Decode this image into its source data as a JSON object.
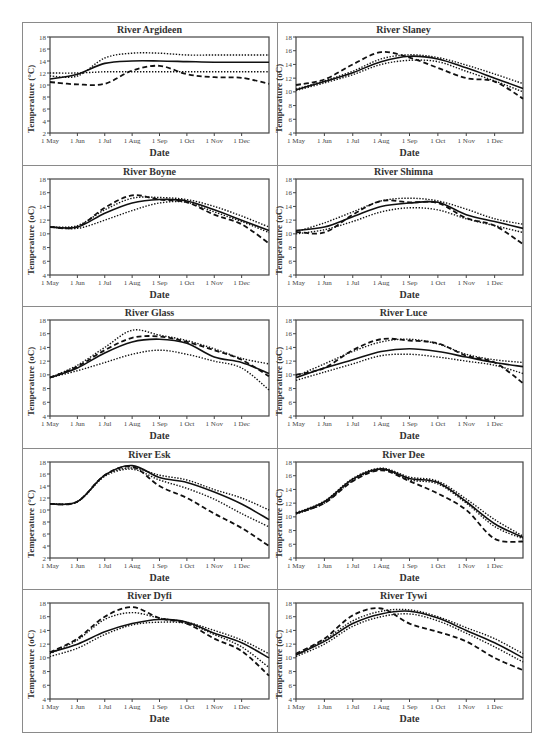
{
  "figure": {
    "x_axis_label": "Date",
    "x_ticks": [
      "1 May",
      "1 Jun",
      "1 Jul",
      "1 Aug",
      "1 Sep",
      "1 Oct",
      "1 Nov",
      "1 Dec"
    ],
    "legend_note": "Four series per panel: solid line, dashed line, upper dotted line, lower dotted line"
  },
  "chart_data": [
    {
      "type": "line",
      "title": "River Argideen",
      "xlabel": "Date",
      "ylabel": "Temperature (°C)",
      "ylim": [
        2,
        18
      ],
      "yticks": [
        2,
        4,
        6,
        8,
        10,
        12,
        14,
        16,
        18
      ],
      "categories": [
        "1 May",
        "1 Jun",
        "1 Jul",
        "1 Aug",
        "1 Sep",
        "1 Oct",
        "1 Nov",
        "1 Dec",
        "31 Dec"
      ],
      "series": [
        {
          "name": "solid",
          "style": "solid",
          "values": [
            11.0,
            11.8,
            13.6,
            14.0,
            14.0,
            13.9,
            13.8,
            13.8,
            13.8
          ]
        },
        {
          "name": "dashed",
          "style": "dashed",
          "values": [
            10.5,
            10.1,
            10.2,
            12.4,
            13.2,
            11.8,
            11.3,
            11.2,
            10.2
          ]
        },
        {
          "name": "upper-dotted",
          "style": "dotted",
          "values": [
            11.5,
            11.5,
            14.5,
            15.3,
            15.3,
            15.0,
            15.0,
            15.0,
            15.0
          ]
        },
        {
          "name": "lower-dotted",
          "style": "dotted",
          "values": [
            12.0,
            12.0,
            12.2,
            12.2,
            12.2,
            12.2,
            12.2,
            12.2,
            12.2
          ]
        }
      ]
    },
    {
      "type": "line",
      "title": "River Slaney",
      "xlabel": "Date",
      "ylabel": "Temperature (oC)",
      "ylim": [
        4,
        18
      ],
      "yticks": [
        4,
        6,
        8,
        10,
        12,
        14,
        16,
        18
      ],
      "categories": [
        "1 May",
        "1 Jun",
        "1 Jul",
        "1 Aug",
        "1 Sep",
        "1 Oct",
        "1 Nov",
        "1 Dec",
        "31 Dec"
      ],
      "series": [
        {
          "name": "solid",
          "style": "solid",
          "values": [
            10.3,
            11.5,
            12.8,
            14.4,
            15.2,
            14.8,
            13.5,
            12.0,
            10.5
          ]
        },
        {
          "name": "dashed",
          "style": "dashed",
          "values": [
            11.0,
            11.8,
            14.0,
            15.8,
            15.0,
            13.5,
            12.0,
            11.5,
            9.0
          ]
        },
        {
          "name": "upper-dotted",
          "style": "dotted",
          "values": [
            10.4,
            11.6,
            13.0,
            14.8,
            15.4,
            15.0,
            13.9,
            12.6,
            11.2
          ]
        },
        {
          "name": "lower-dotted",
          "style": "dotted",
          "values": [
            10.2,
            11.3,
            12.5,
            14.0,
            14.6,
            14.4,
            13.0,
            11.6,
            10.0
          ]
        }
      ]
    },
    {
      "type": "line",
      "title": "River Boyne",
      "xlabel": "Date",
      "ylabel": "Temperature (oC)",
      "ylim": [
        4,
        18
      ],
      "yticks": [
        4,
        6,
        8,
        10,
        12,
        14,
        16,
        18
      ],
      "categories": [
        "1 May",
        "1 Jun",
        "1 Jul",
        "1 Aug",
        "1 Sep",
        "1 Oct",
        "1 Nov",
        "1 Dec",
        "31 Dec"
      ],
      "series": [
        {
          "name": "solid",
          "style": "solid",
          "values": [
            11.0,
            11.0,
            13.0,
            14.5,
            15.0,
            14.8,
            13.5,
            12.0,
            10.5
          ]
        },
        {
          "name": "dashed",
          "style": "dashed",
          "values": [
            11.0,
            11.0,
            13.8,
            15.6,
            15.0,
            14.6,
            12.8,
            11.4,
            8.6
          ]
        },
        {
          "name": "upper-dotted",
          "style": "dotted",
          "values": [
            11.0,
            11.2,
            13.5,
            15.2,
            15.3,
            15.0,
            14.0,
            12.6,
            11.0
          ]
        },
        {
          "name": "lower-dotted",
          "style": "dotted",
          "values": [
            11.0,
            10.8,
            12.0,
            13.4,
            14.5,
            14.6,
            13.2,
            11.8,
            10.2
          ]
        }
      ]
    },
    {
      "type": "line",
      "title": "River Shimna",
      "xlabel": "Date",
      "ylabel": "Temperature (oC)",
      "ylim": [
        4,
        18
      ],
      "yticks": [
        4,
        6,
        8,
        10,
        12,
        14,
        16,
        18
      ],
      "categories": [
        "1 May",
        "1 Jun",
        "1 Jul",
        "1 Aug",
        "1 Sep",
        "1 Oct",
        "1 Nov",
        "1 Dec",
        "31 Dec"
      ],
      "series": [
        {
          "name": "solid",
          "style": "solid",
          "values": [
            10.5,
            11.0,
            12.5,
            14.0,
            14.5,
            14.6,
            12.8,
            11.8,
            10.8
          ]
        },
        {
          "name": "dashed",
          "style": "dashed",
          "values": [
            10.3,
            10.2,
            12.8,
            14.8,
            14.6,
            14.5,
            12.3,
            11.2,
            8.5
          ]
        },
        {
          "name": "upper-dotted",
          "style": "dotted",
          "values": [
            10.3,
            11.6,
            13.2,
            14.8,
            15.2,
            14.8,
            13.6,
            12.2,
            11.4
          ]
        },
        {
          "name": "lower-dotted",
          "style": "dotted",
          "values": [
            10.0,
            10.6,
            11.8,
            13.2,
            13.8,
            13.5,
            12.2,
            11.2,
            10.2
          ]
        }
      ]
    },
    {
      "type": "line",
      "title": "River Glass",
      "xlabel": "Date",
      "ylabel": "Temperature (oC)",
      "ylim": [
        4,
        18
      ],
      "yticks": [
        4,
        6,
        8,
        10,
        12,
        14,
        16,
        18
      ],
      "categories": [
        "1 May",
        "1 Jun",
        "1 Jul",
        "1 Aug",
        "1 Sep",
        "1 Oct",
        "1 Nov",
        "1 Dec",
        "31 Dec"
      ],
      "series": [
        {
          "name": "solid",
          "style": "solid",
          "values": [
            9.6,
            11.0,
            13.2,
            14.8,
            15.2,
            14.6,
            12.6,
            11.8,
            10.2
          ]
        },
        {
          "name": "dashed",
          "style": "dashed",
          "values": [
            9.6,
            11.2,
            13.6,
            15.4,
            15.6,
            14.8,
            13.6,
            12.2,
            9.8
          ]
        },
        {
          "name": "upper-dotted",
          "style": "dotted",
          "values": [
            9.6,
            11.4,
            14.0,
            16.5,
            15.8,
            15.0,
            13.8,
            12.4,
            11.6
          ]
        },
        {
          "name": "lower-dotted",
          "style": "dotted",
          "values": [
            9.6,
            10.6,
            11.8,
            13.0,
            13.6,
            13.0,
            12.0,
            11.0,
            7.8
          ]
        }
      ]
    },
    {
      "type": "line",
      "title": "River Luce",
      "xlabel": "Date",
      "ylabel": "Temperature (oC)",
      "ylim": [
        4,
        18
      ],
      "yticks": [
        4,
        6,
        8,
        10,
        12,
        14,
        16,
        18
      ],
      "categories": [
        "1 May",
        "1 Jun",
        "1 Jul",
        "1 Aug",
        "1 Sep",
        "1 Oct",
        "1 Nov",
        "1 Dec",
        "31 Dec"
      ],
      "series": [
        {
          "name": "solid",
          "style": "solid",
          "values": [
            9.6,
            11.0,
            12.2,
            13.4,
            13.8,
            13.4,
            12.6,
            11.8,
            11.2
          ]
        },
        {
          "name": "dashed",
          "style": "dashed",
          "values": [
            10.0,
            11.0,
            13.6,
            15.2,
            15.0,
            14.6,
            12.8,
            11.8,
            8.8
          ]
        },
        {
          "name": "upper-dotted",
          "style": "dotted",
          "values": [
            9.8,
            11.6,
            13.4,
            14.8,
            15.2,
            14.5,
            13.0,
            12.2,
            11.8
          ]
        },
        {
          "name": "lower-dotted",
          "style": "dotted",
          "values": [
            9.2,
            10.4,
            11.6,
            12.8,
            13.0,
            12.6,
            12.0,
            11.4,
            10.2
          ]
        }
      ]
    },
    {
      "type": "line",
      "title": "River Esk",
      "xlabel": "Date",
      "ylabel": "Temperature (°C)",
      "ylim": [
        2,
        18
      ],
      "yticks": [
        2,
        4,
        6,
        8,
        10,
        12,
        14,
        16,
        18
      ],
      "categories": [
        "1 May",
        "1 Jun",
        "1 Jul",
        "1 Aug",
        "1 Sep",
        "1 Oct",
        "1 Nov",
        "1 Dec",
        "31 Dec"
      ],
      "series": [
        {
          "name": "solid",
          "style": "solid",
          "values": [
            11.0,
            11.4,
            15.8,
            17.4,
            15.4,
            14.6,
            13.0,
            11.0,
            8.4
          ]
        },
        {
          "name": "dashed",
          "style": "dashed",
          "values": [
            11.0,
            11.4,
            15.8,
            17.2,
            14.0,
            12.0,
            9.4,
            7.0,
            4.0
          ]
        },
        {
          "name": "upper-dotted",
          "style": "dotted",
          "values": [
            11.0,
            11.4,
            15.8,
            17.0,
            15.8,
            15.0,
            13.4,
            12.0,
            10.0
          ]
        },
        {
          "name": "lower-dotted",
          "style": "dotted",
          "values": [
            11.0,
            11.4,
            15.6,
            16.8,
            15.0,
            13.6,
            11.8,
            9.4,
            7.2
          ]
        }
      ]
    },
    {
      "type": "line",
      "title": "River Dee",
      "xlabel": "Date",
      "ylabel": "Temperature (oC)",
      "ylim": [
        4,
        18
      ],
      "yticks": [
        4,
        6,
        8,
        10,
        12,
        14,
        16,
        18
      ],
      "categories": [
        "1 May",
        "1 Jun",
        "1 Jul",
        "1 Aug",
        "1 Sep",
        "1 Oct",
        "1 Nov",
        "1 Dec",
        "31 Dec"
      ],
      "series": [
        {
          "name": "solid",
          "style": "solid",
          "values": [
            10.5,
            12.2,
            15.5,
            17.0,
            15.6,
            15.0,
            12.2,
            9.0,
            7.0
          ]
        },
        {
          "name": "dashed",
          "style": "dashed",
          "values": [
            10.5,
            12.0,
            15.2,
            16.8,
            15.2,
            13.4,
            11.0,
            6.8,
            6.4
          ]
        },
        {
          "name": "upper-dotted",
          "style": "dotted",
          "values": [
            10.6,
            12.3,
            15.6,
            17.1,
            15.8,
            15.2,
            12.6,
            9.6,
            7.2
          ]
        },
        {
          "name": "lower-dotted",
          "style": "dotted",
          "values": [
            10.4,
            12.0,
            15.3,
            16.9,
            15.4,
            14.8,
            12.0,
            8.6,
            6.8
          ]
        }
      ]
    },
    {
      "type": "line",
      "title": "River Dyfi",
      "xlabel": "Date",
      "ylabel": "Temperature (oC)",
      "ylim": [
        4,
        18
      ],
      "yticks": [
        4,
        6,
        8,
        10,
        12,
        14,
        16,
        18
      ],
      "categories": [
        "1 May",
        "1 Jun",
        "1 Jul",
        "1 Aug",
        "1 Sep",
        "1 Oct",
        "1 Nov",
        "1 Dec",
        "31 Dec"
      ],
      "series": [
        {
          "name": "solid",
          "style": "solid",
          "values": [
            10.8,
            12.0,
            13.8,
            15.0,
            15.6,
            15.2,
            13.6,
            12.2,
            10.0
          ]
        },
        {
          "name": "dashed",
          "style": "dashed",
          "values": [
            10.8,
            12.8,
            16.0,
            17.4,
            15.8,
            15.0,
            12.8,
            11.0,
            7.4
          ]
        },
        {
          "name": "upper-dotted",
          "style": "dotted",
          "values": [
            10.6,
            12.6,
            15.6,
            16.6,
            15.8,
            15.2,
            14.0,
            12.6,
            10.6
          ]
        },
        {
          "name": "lower-dotted",
          "style": "dotted",
          "values": [
            10.2,
            11.4,
            13.4,
            14.8,
            15.2,
            15.0,
            13.4,
            11.6,
            8.6
          ]
        }
      ]
    },
    {
      "type": "line",
      "title": "River Tywi",
      "xlabel": "Date",
      "ylabel": "Temperature (oC)",
      "ylim": [
        4,
        18
      ],
      "yticks": [
        4,
        6,
        8,
        10,
        12,
        14,
        16,
        18
      ],
      "categories": [
        "1 May",
        "1 Jun",
        "1 Jul",
        "1 Aug",
        "1 Sep",
        "1 Oct",
        "1 Nov",
        "1 Dec",
        "31 Dec"
      ],
      "series": [
        {
          "name": "solid",
          "style": "solid",
          "values": [
            10.4,
            12.4,
            15.0,
            16.4,
            16.8,
            15.8,
            14.0,
            12.2,
            10.0
          ]
        },
        {
          "name": "dashed",
          "style": "dashed",
          "values": [
            10.6,
            12.8,
            16.2,
            17.2,
            15.0,
            13.8,
            12.4,
            10.0,
            8.2
          ]
        },
        {
          "name": "upper-dotted",
          "style": "dotted",
          "values": [
            10.5,
            12.6,
            15.4,
            16.8,
            17.0,
            16.0,
            14.4,
            12.8,
            10.6
          ]
        },
        {
          "name": "lower-dotted",
          "style": "dotted",
          "values": [
            10.2,
            12.0,
            14.6,
            16.0,
            16.4,
            15.4,
            13.6,
            11.6,
            9.4
          ]
        }
      ]
    }
  ]
}
